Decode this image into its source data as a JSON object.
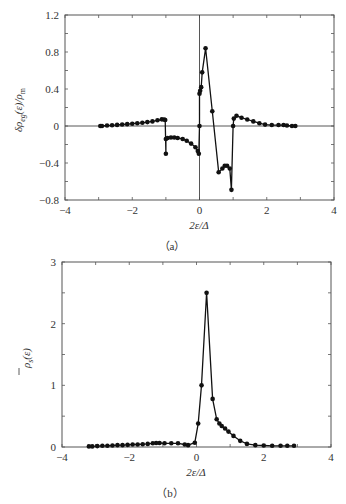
{
  "chart_data": [
    {
      "type": "line",
      "panel_label": "（a）",
      "title": "",
      "xlabel": "2ε/Δ",
      "ylabel": "δρeg(ε)/ρm",
      "xlim": [
        -4,
        4
      ],
      "ylim": [
        -0.8,
        1.2
      ],
      "xticks": [
        -4,
        -2,
        0,
        2,
        4
      ],
      "xtick_labels": [
        "−4",
        "−2",
        "0",
        "2",
        "4"
      ],
      "yticks": [
        -0.8,
        -0.4,
        0,
        0.4,
        0.8,
        1.2
      ],
      "ytick_labels": [
        "−0.8",
        "−0.4",
        "0",
        "0.4",
        "0.8",
        "1.2"
      ],
      "grid": false,
      "zero_lines": true,
      "series": [
        {
          "name": "δρeg",
          "x": [
            -2.95,
            -2.9,
            -2.75,
            -2.6,
            -2.45,
            -2.3,
            -2.15,
            -2.0,
            -1.85,
            -1.7,
            -1.55,
            -1.4,
            -1.25,
            -1.12,
            -1.05,
            -1.02,
            -1.0,
            -1.0,
            -0.95,
            -0.85,
            -0.75,
            -0.65,
            -0.5,
            -0.38,
            -0.25,
            -0.12,
            -0.05,
            -0.02,
            0.0,
            0.0,
            0.02,
            0.05,
            0.08,
            0.18,
            0.38,
            0.57,
            0.68,
            0.75,
            0.82,
            0.9,
            0.95,
            1.0,
            1.02,
            1.1,
            1.25,
            1.42,
            1.6,
            1.78,
            1.95,
            2.15,
            2.35,
            2.5,
            2.6,
            2.75,
            2.85
          ],
          "y": [
            0.0,
            0.0,
            0.005,
            0.008,
            0.012,
            0.016,
            0.02,
            0.025,
            0.03,
            0.035,
            0.042,
            0.05,
            0.062,
            0.072,
            0.07,
            0.065,
            -0.3,
            -0.14,
            -0.13,
            -0.125,
            -0.125,
            -0.13,
            -0.14,
            -0.16,
            -0.19,
            -0.23,
            -0.27,
            -0.3,
            0.0,
            0.35,
            0.38,
            0.42,
            0.58,
            0.84,
            0.16,
            -0.5,
            -0.46,
            -0.43,
            -0.43,
            -0.46,
            -0.69,
            0.0,
            0.08,
            0.11,
            0.09,
            0.07,
            0.05,
            0.03,
            0.015,
            0.01,
            0.01,
            0.01,
            0.005,
            0.0,
            0.0
          ]
        }
      ]
    },
    {
      "type": "line",
      "panel_label": "（b）",
      "title": "",
      "xlabel": "2ε/Δ",
      "ylabel": "ρ̄s(ε)",
      "xlim": [
        -4,
        4
      ],
      "ylim": [
        0,
        3
      ],
      "xticks": [
        -4,
        -2,
        0,
        2,
        4
      ],
      "xtick_labels": [
        "−4",
        "−2",
        "0",
        "2",
        "4"
      ],
      "yticks": [
        0,
        1,
        2,
        3
      ],
      "ytick_labels": [
        "0",
        "1",
        "2",
        "3"
      ],
      "grid": false,
      "series": [
        {
          "name": "ρ̄s",
          "x": [
            -3.2,
            -3.1,
            -2.95,
            -2.8,
            -2.65,
            -2.5,
            -2.35,
            -2.2,
            -2.05,
            -1.9,
            -1.75,
            -1.6,
            -1.45,
            -1.3,
            -1.2,
            -1.1,
            -0.95,
            -0.75,
            -0.55,
            -0.35,
            -0.25,
            -0.05,
            0.05,
            0.15,
            0.3,
            0.48,
            0.6,
            0.68,
            0.75,
            0.85,
            0.95,
            1.1,
            1.3,
            1.5,
            1.75,
            2.0,
            2.25,
            2.5,
            2.7,
            2.9
          ],
          "y": [
            0.01,
            0.01,
            0.015,
            0.02,
            0.02,
            0.025,
            0.03,
            0.03,
            0.035,
            0.04,
            0.04,
            0.045,
            0.05,
            0.06,
            0.065,
            0.065,
            0.06,
            0.06,
            0.06,
            0.04,
            0.03,
            0.07,
            0.38,
            1.0,
            2.5,
            0.78,
            0.45,
            0.38,
            0.34,
            0.3,
            0.25,
            0.18,
            0.1,
            0.05,
            0.03,
            0.025,
            0.02,
            0.02,
            0.02,
            0.02
          ]
        }
      ]
    }
  ],
  "panels": {
    "a": {
      "caption": "（a）",
      "xlabel": "2ε/Δ",
      "ylabel_main": "δρ",
      "ylabel_sub": "eg",
      "ylabel_tail": "(ε)/ρ",
      "ylabel_sub2": "m"
    },
    "b": {
      "caption": "（b）",
      "xlabel": "2ε/Δ",
      "ylabel_main": "ρ",
      "ylabel_sub": "s",
      "ylabel_tail": "(ε)"
    }
  }
}
